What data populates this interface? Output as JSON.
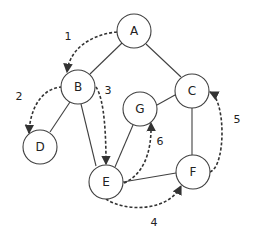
{
  "diagram": {
    "type": "graph-traversal",
    "nodes": [
      {
        "id": "A",
        "label": "A",
        "x": 134,
        "y": 31
      },
      {
        "id": "B",
        "label": "B",
        "x": 78,
        "y": 87
      },
      {
        "id": "C",
        "label": "C",
        "x": 192,
        "y": 91
      },
      {
        "id": "G",
        "label": "G",
        "x": 140,
        "y": 109
      },
      {
        "id": "D",
        "label": "D",
        "x": 40,
        "y": 147
      },
      {
        "id": "E",
        "label": "E",
        "x": 106,
        "y": 182
      },
      {
        "id": "F",
        "label": "F",
        "x": 193,
        "y": 172
      }
    ],
    "edges": [
      {
        "from": "A",
        "to": "B"
      },
      {
        "from": "A",
        "to": "C"
      },
      {
        "from": "B",
        "to": "D"
      },
      {
        "from": "B",
        "to": "E"
      },
      {
        "from": "C",
        "to": "G"
      },
      {
        "from": "C",
        "to": "F"
      },
      {
        "from": "G",
        "to": "E"
      },
      {
        "from": "E",
        "to": "F"
      }
    ],
    "traversal_steps": [
      {
        "step": "1",
        "from": "A",
        "to": "B",
        "label_x": 68,
        "label_y": 36
      },
      {
        "step": "2",
        "from": "B",
        "to": "D",
        "label_x": 19,
        "label_y": 96
      },
      {
        "step": "3",
        "from": "B",
        "to": "E",
        "label_x": 108,
        "label_y": 90
      },
      {
        "step": "4",
        "from": "E",
        "to": "F",
        "label_x": 154,
        "label_y": 222
      },
      {
        "step": "5",
        "from": "F",
        "to": "C",
        "label_x": 237,
        "label_y": 119
      },
      {
        "step": "6",
        "from": "E",
        "to": "G",
        "label_x": 160,
        "label_y": 141
      }
    ]
  }
}
